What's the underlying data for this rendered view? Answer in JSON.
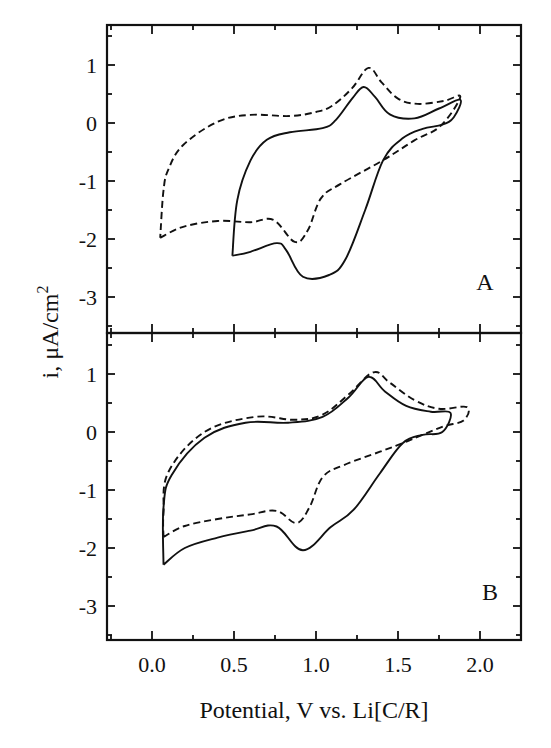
{
  "chart_data": {
    "type": "line",
    "layout": "two vertically stacked panels sharing x-axis",
    "xlabel": "Potential, V vs. Li[C/R]",
    "ylabel": "i, μA/cm²",
    "ylabel_parts": {
      "main": "i, μA/cm",
      "sup": "2"
    },
    "xlim": [
      -0.27,
      2.25
    ],
    "x_ticks": [
      0.0,
      0.5,
      1.0,
      1.5,
      2.0
    ],
    "x_tick_labels": [
      "0.0",
      "0.5",
      "1.0",
      "1.5",
      "2.0"
    ],
    "x_minor_ticks": [
      0.25,
      0.75,
      1.25,
      1.75
    ],
    "grid": false,
    "legend": "none",
    "series_styles": {
      "solid": "solid black line",
      "dashed": "dashed black line"
    },
    "panels": [
      {
        "label": "A",
        "ylim": [
          -3.6,
          1.7
        ],
        "y_ticks": [
          1,
          0,
          -1,
          -2,
          -3
        ],
        "y_tick_labels": [
          "1",
          "0",
          "-1",
          "-2",
          "-3"
        ],
        "series": [
          {
            "name": "solid",
            "style": "solid",
            "points": [
              [
                0.49,
                -2.29
              ],
              [
                0.6,
                -2.22
              ],
              [
                0.76,
                -2.07
              ],
              [
                0.82,
                -2.2
              ],
              [
                0.92,
                -2.65
              ],
              [
                1.08,
                -2.62
              ],
              [
                1.18,
                -2.35
              ],
              [
                1.3,
                -1.5
              ],
              [
                1.41,
                -0.64
              ],
              [
                1.53,
                -0.26
              ],
              [
                1.65,
                -0.1
              ],
              [
                1.77,
                -0.03
              ],
              [
                1.84,
                0.1
              ],
              [
                1.88,
                0.4
              ],
              [
                1.75,
                0.25
              ],
              [
                1.6,
                0.08
              ],
              [
                1.45,
                0.15
              ],
              [
                1.36,
                0.45
              ],
              [
                1.29,
                0.62
              ],
              [
                1.22,
                0.42
              ],
              [
                1.12,
                0.05
              ],
              [
                1.04,
                -0.09
              ],
              [
                0.84,
                -0.16
              ],
              [
                0.7,
                -0.29
              ],
              [
                0.6,
                -0.65
              ],
              [
                0.52,
                -1.33
              ],
              [
                0.49,
                -2.29
              ]
            ]
          },
          {
            "name": "dashed",
            "style": "dashed",
            "points": [
              [
                0.05,
                -1.98
              ],
              [
                0.19,
                -1.79
              ],
              [
                0.4,
                -1.69
              ],
              [
                0.6,
                -1.71
              ],
              [
                0.74,
                -1.67
              ],
              [
                0.87,
                -2.05
              ],
              [
                0.95,
                -1.85
              ],
              [
                1.03,
                -1.3
              ],
              [
                1.15,
                -1.05
              ],
              [
                1.41,
                -0.64
              ],
              [
                1.6,
                -0.3
              ],
              [
                1.76,
                -0.05
              ],
              [
                1.88,
                0.45
              ],
              [
                1.78,
                0.38
              ],
              [
                1.62,
                0.33
              ],
              [
                1.5,
                0.42
              ],
              [
                1.4,
                0.7
              ],
              [
                1.32,
                0.95
              ],
              [
                1.22,
                0.6
              ],
              [
                1.1,
                0.3
              ],
              [
                1.0,
                0.19
              ],
              [
                0.84,
                0.12
              ],
              [
                0.6,
                0.14
              ],
              [
                0.4,
                0.02
              ],
              [
                0.19,
                -0.38
              ],
              [
                0.1,
                -0.8
              ],
              [
                0.07,
                -1.16
              ],
              [
                0.05,
                -1.98
              ]
            ]
          }
        ]
      },
      {
        "label": "B",
        "ylim": [
          -3.6,
          1.7
        ],
        "y_ticks": [
          1,
          0,
          -1,
          -2,
          -3
        ],
        "y_tick_labels": [
          "1",
          "0",
          "-1",
          "-2",
          "-3"
        ],
        "series": [
          {
            "name": "solid",
            "style": "solid",
            "points": [
              [
                0.07,
                -2.29
              ],
              [
                0.2,
                -2.0
              ],
              [
                0.4,
                -1.82
              ],
              [
                0.6,
                -1.7
              ],
              [
                0.76,
                -1.63
              ],
              [
                0.92,
                -2.04
              ],
              [
                1.09,
                -1.64
              ],
              [
                1.23,
                -1.34
              ],
              [
                1.39,
                -0.71
              ],
              [
                1.53,
                -0.19
              ],
              [
                1.65,
                -0.05
              ],
              [
                1.77,
                0.0
              ],
              [
                1.82,
                0.33
              ],
              [
                1.7,
                0.35
              ],
              [
                1.55,
                0.45
              ],
              [
                1.42,
                0.7
              ],
              [
                1.32,
                0.95
              ],
              [
                1.2,
                0.6
              ],
              [
                1.04,
                0.26
              ],
              [
                0.83,
                0.16
              ],
              [
                0.57,
                0.16
              ],
              [
                0.32,
                -0.1
              ],
              [
                0.12,
                -0.74
              ],
              [
                0.07,
                -1.3
              ],
              [
                0.07,
                -2.29
              ]
            ]
          },
          {
            "name": "dashed",
            "style": "dashed",
            "points": [
              [
                0.07,
                -1.81
              ],
              [
                0.2,
                -1.62
              ],
              [
                0.4,
                -1.5
              ],
              [
                0.6,
                -1.42
              ],
              [
                0.76,
                -1.36
              ],
              [
                0.88,
                -1.57
              ],
              [
                0.96,
                -1.3
              ],
              [
                1.04,
                -0.78
              ],
              [
                1.17,
                -0.57
              ],
              [
                1.39,
                -0.34
              ],
              [
                1.53,
                -0.19
              ],
              [
                1.65,
                -0.05
              ],
              [
                1.78,
                0.1
              ],
              [
                1.9,
                0.2
              ],
              [
                1.92,
                0.43
              ],
              [
                1.75,
                0.4
              ],
              [
                1.6,
                0.55
              ],
              [
                1.45,
                0.85
              ],
              [
                1.35,
                1.03
              ],
              [
                1.2,
                0.65
              ],
              [
                1.04,
                0.3
              ],
              [
                0.87,
                0.21
              ],
              [
                0.63,
                0.26
              ],
              [
                0.32,
                0.0
              ],
              [
                0.1,
                -0.69
              ],
              [
                0.07,
                -1.4
              ],
              [
                0.07,
                -1.81
              ]
            ]
          }
        ]
      }
    ]
  }
}
